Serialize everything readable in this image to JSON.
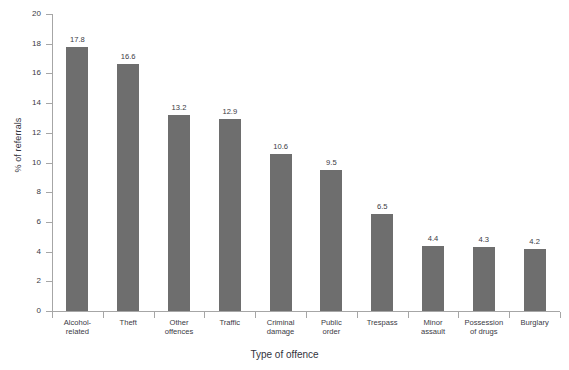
{
  "chart_data": {
    "type": "bar",
    "title": "",
    "subtitle": "",
    "xlabel": "Type of offence",
    "ylabel": "% of referrals",
    "categories": [
      "Alcohol-\nrelated",
      "Theft",
      "Other\noffences",
      "Traffic",
      "Criminal\ndamage",
      "Public\norder",
      "Trespass",
      "Minor\nassault",
      "Possession\nof drugs",
      "Burglary"
    ],
    "values": [
      17.8,
      16.6,
      13.2,
      12.9,
      10.6,
      9.5,
      6.5,
      4.4,
      4.3,
      4.2
    ],
    "value_labels": [
      "17.8",
      "16.6",
      "13.2",
      "12.9",
      "10.6",
      "9.5",
      "6.5",
      "4.4",
      "4.3",
      "4.2"
    ],
    "ylim": [
      0,
      20
    ],
    "ytick_values": [
      0,
      2,
      4,
      6,
      8,
      10,
      12,
      14,
      16,
      18,
      20
    ],
    "ytick_labels": [
      "0",
      "2",
      "4",
      "6",
      "8",
      "10",
      "12",
      "14",
      "16",
      "18",
      "20"
    ],
    "grid": false,
    "legend": false,
    "legend_position": "none",
    "bar_color": "#6e6e6e",
    "axis_color": "#a6a6a6",
    "text_color": "#3a3a44",
    "background_color": "#ffffff"
  }
}
